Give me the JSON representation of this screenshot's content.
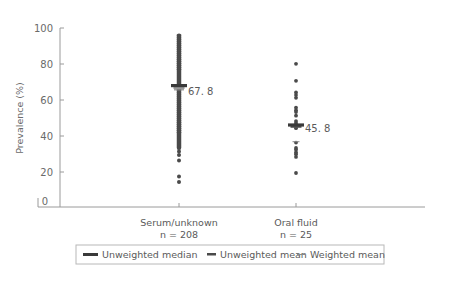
{
  "chart_data": {
    "type": "scatter",
    "title": "",
    "xlabel": "",
    "ylabel": "Prevalence (%)",
    "ylim": [
      0,
      100
    ],
    "yticks": [
      0,
      20,
      40,
      60,
      80,
      100
    ],
    "grid": false,
    "legend_position": "bottom",
    "categories": [
      {
        "name": "Serum/unknown",
        "n_label": "n = 208",
        "n": 208
      },
      {
        "name": "Oral fluid",
        "n_label": "n = 25",
        "n": 25
      }
    ],
    "series": [
      {
        "name": "Serum/unknown",
        "range_dense": [
          33,
          96.5
        ],
        "points_sparse": [
          31,
          29,
          26,
          17,
          14
        ],
        "unweighted_median": 67.8,
        "unweighted_mean": 66.5,
        "weighted_mean": 65.5,
        "median_label": "67.8"
      },
      {
        "name": "Oral fluid",
        "points": [
          80,
          70.5,
          64,
          62.5,
          61,
          55.5,
          54,
          53,
          51,
          48,
          47,
          46,
          45,
          44,
          36,
          33,
          32,
          30.5,
          29.5,
          28,
          19
        ],
        "unweighted_median": 45.8,
        "unweighted_mean": 44.8,
        "weighted_mean": 36.5,
        "median_label": "45.8"
      }
    ],
    "legend": [
      {
        "key": "unweighted_median",
        "label": "Unweighted median"
      },
      {
        "key": "unweighted_mean",
        "label": "Unweighted mean"
      },
      {
        "key": "weighted_mean",
        "label": "Weighted mean"
      }
    ],
    "colors": {
      "points": "#4a4a4a",
      "median": "#3a3a3a",
      "mean": "#555555",
      "weighted_mean": "#8a8a8a",
      "axis": "#9a9a9a"
    }
  },
  "axis": {
    "ylabel": "Prevalence (%)",
    "ticks": [
      "0",
      "20",
      "40",
      "60",
      "80",
      "100"
    ]
  },
  "labels": {
    "serum_name": "Serum/unknown",
    "serum_n": "n = 208",
    "oral_name": "Oral fluid",
    "oral_n": "n = 25",
    "serum_median": "67. 8",
    "oral_median": "45. 8"
  },
  "legend": {
    "median": "Unweighted median",
    "mean": "Unweighted mean",
    "wmean": "Weighted mean"
  }
}
